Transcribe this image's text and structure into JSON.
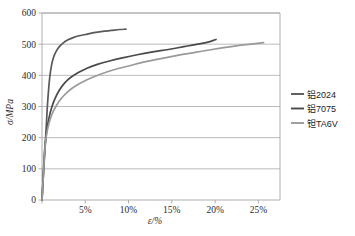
{
  "chart_data": {
    "type": "line",
    "title": "",
    "xlabel": "ε/%",
    "ylabel": "σ/MPa",
    "xlim": [
      0,
      27.5
    ],
    "ylim": [
      0,
      600
    ],
    "grid": true,
    "grid_axis": "y",
    "legend_position": "right",
    "x_ticks": [
      0,
      5,
      10,
      15,
      20,
      25
    ],
    "x_tick_labels": [
      "",
      "5%",
      "10%",
      "15%",
      "20%",
      "25%"
    ],
    "y_ticks": [
      0,
      100,
      200,
      300,
      400,
      500,
      600
    ],
    "y_tick_labels": [
      "0",
      "100",
      "200",
      "300",
      "400",
      "500",
      "600"
    ],
    "series": [
      {
        "name": "铝2024",
        "color": "#595959",
        "x": [
          0,
          0.12,
          0.25,
          0.38,
          0.5,
          0.62,
          0.75,
          0.9,
          1.1,
          1.3,
          1.6,
          2.0,
          2.5,
          3.0,
          3.6,
          4.3,
          5.0,
          6.0,
          7.0,
          8.0,
          9.0,
          9.7
        ],
        "y": [
          0,
          60,
          120,
          180,
          240,
          300,
          350,
          395,
          432,
          455,
          475,
          492,
          505,
          514,
          521,
          527,
          531,
          537,
          541,
          544,
          547,
          548
        ]
      },
      {
        "name": "铝7075",
        "color": "#4a4a4a",
        "x": [
          0,
          0.1,
          0.2,
          0.32,
          0.45,
          0.6,
          0.8,
          1.1,
          1.5,
          2.0,
          2.6,
          3.3,
          4.2,
          5.2,
          6.4,
          7.8,
          9.3,
          11.0,
          12.8,
          14.6,
          16.4,
          18.2,
          19.5,
          20.1
        ],
        "y": [
          0,
          55,
          110,
          165,
          200,
          232,
          262,
          295,
          325,
          352,
          375,
          393,
          409,
          423,
          435,
          446,
          456,
          466,
          475,
          483,
          492,
          501,
          509,
          515
        ]
      },
      {
        "name": "钽TA6V",
        "color": "#9a9a9a",
        "x": [
          0,
          0.1,
          0.2,
          0.3,
          0.42,
          0.58,
          0.8,
          1.1,
          1.6,
          2.2,
          3.0,
          4.0,
          5.2,
          6.6,
          8.2,
          10.0,
          12.0,
          14.2,
          16.4,
          18.6,
          20.8,
          22.8,
          24.4,
          25.6
        ],
        "y": [
          0,
          50,
          100,
          150,
          190,
          218,
          245,
          272,
          300,
          325,
          348,
          368,
          386,
          402,
          417,
          430,
          444,
          456,
          468,
          478,
          488,
          496,
          501,
          505
        ]
      }
    ]
  },
  "legend": {
    "items": [
      {
        "label": "铝2024",
        "color": "#595959"
      },
      {
        "label": "铝7075",
        "color": "#4a4a4a"
      },
      {
        "label": "钽TA6V",
        "color": "#9a9a9a"
      }
    ]
  },
  "axes": {
    "y_title": "σ/MPa",
    "x_title": "ε/%"
  },
  "style": {
    "plot_border": "#a6a6a6",
    "grid_color": "#aaaaaa",
    "background": "#ffffff"
  }
}
